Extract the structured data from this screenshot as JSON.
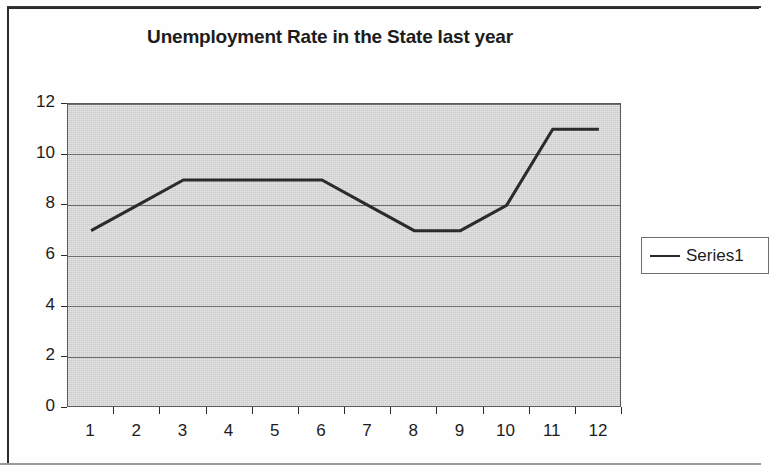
{
  "chart_data": {
    "type": "line",
    "title": "Unemployment Rate in the State last year",
    "xlabel": "",
    "ylabel": "",
    "categories": [
      "1",
      "2",
      "3",
      "4",
      "5",
      "6",
      "7",
      "8",
      "9",
      "10",
      "11",
      "12"
    ],
    "series": [
      {
        "name": "Series1",
        "values": [
          7,
          8,
          9,
          9,
          9,
          9,
          8,
          7,
          7,
          8,
          11,
          11
        ],
        "color": "#2b2b2b"
      }
    ],
    "ylim": [
      0,
      12
    ],
    "y_ticks": [
      "0",
      "2",
      "4",
      "6",
      "8",
      "10",
      "12"
    ],
    "grid": true,
    "legend_position": "right",
    "plot_background_color": "#d7d7d7",
    "line_color": "#2b2b2b"
  },
  "legend": {
    "entries": [
      {
        "label": "Series1"
      }
    ]
  },
  "frame": {
    "border_color": "#2b2b2b"
  }
}
